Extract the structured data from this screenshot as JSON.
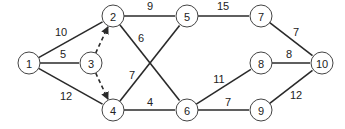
{
  "diagram": {
    "type": "network-graph",
    "nodes": [
      {
        "id": "1",
        "label": "1",
        "x": 29,
        "y": 63
      },
      {
        "id": "2",
        "label": "2",
        "x": 113,
        "y": 16
      },
      {
        "id": "3",
        "label": "3",
        "x": 91,
        "y": 63
      },
      {
        "id": "4",
        "label": "4",
        "x": 113,
        "y": 110
      },
      {
        "id": "5",
        "label": "5",
        "x": 187,
        "y": 16
      },
      {
        "id": "6",
        "label": "6",
        "x": 187,
        "y": 110
      },
      {
        "id": "7",
        "label": "7",
        "x": 261,
        "y": 16
      },
      {
        "id": "8",
        "label": "8",
        "x": 261,
        "y": 63
      },
      {
        "id": "9",
        "label": "9",
        "x": 261,
        "y": 110
      },
      {
        "id": "10",
        "label": "10",
        "x": 322,
        "y": 63
      }
    ],
    "edges": [
      {
        "from": "1",
        "to": "2",
        "weight": "10",
        "style": "solid",
        "lx": 61,
        "ly": 32
      },
      {
        "from": "1",
        "to": "3",
        "weight": "5",
        "style": "solid",
        "lx": 63,
        "ly": 54
      },
      {
        "from": "1",
        "to": "4",
        "weight": "12",
        "style": "solid",
        "lx": 66,
        "ly": 96
      },
      {
        "from": "3",
        "to": "2",
        "weight": "",
        "style": "dashed-arrow"
      },
      {
        "from": "3",
        "to": "4",
        "weight": "",
        "style": "dashed-arrow"
      },
      {
        "from": "2",
        "to": "5",
        "weight": "9",
        "style": "solid",
        "lx": 150,
        "ly": 6
      },
      {
        "from": "2",
        "to": "6",
        "weight": "6",
        "style": "solid",
        "lx": 141,
        "ly": 38
      },
      {
        "from": "4",
        "to": "5",
        "weight": "7",
        "style": "solid",
        "lx": 132,
        "ly": 75
      },
      {
        "from": "4",
        "to": "6",
        "weight": "4",
        "style": "solid",
        "lx": 150,
        "ly": 102
      },
      {
        "from": "5",
        "to": "7",
        "weight": "15",
        "style": "solid",
        "lx": 223,
        "ly": 6
      },
      {
        "from": "6",
        "to": "8",
        "weight": "11",
        "style": "solid",
        "lx": 219,
        "ly": 79
      },
      {
        "from": "6",
        "to": "9",
        "weight": "7",
        "style": "solid",
        "lx": 228,
        "ly": 102
      },
      {
        "from": "7",
        "to": "10",
        "weight": "7",
        "style": "solid",
        "lx": 296,
        "ly": 32
      },
      {
        "from": "8",
        "to": "10",
        "weight": "8",
        "style": "solid",
        "lx": 289,
        "ly": 54
      },
      {
        "from": "9",
        "to": "10",
        "weight": "12",
        "style": "solid",
        "lx": 296,
        "ly": 95
      }
    ]
  }
}
